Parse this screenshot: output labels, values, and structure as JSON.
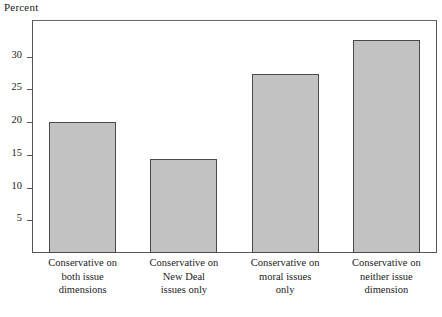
{
  "chart_data": {
    "type": "bar",
    "title": "",
    "subtitle": "",
    "xlabel": "",
    "ylabel": "Percent",
    "ylim": [
      0,
      35.6
    ],
    "grid": false,
    "legend": null,
    "yticks": [
      5,
      10,
      15,
      20,
      25,
      30
    ],
    "ytick_labels": [
      "5",
      "10",
      "15",
      "20",
      "25",
      "30"
    ],
    "categories": [
      "Conservative on both issue dimensions",
      "Conservative on New Deal issues only",
      "Conservative on moral issues only",
      "Conservative on neither issue dimension"
    ],
    "category_label_lines": [
      [
        "Conservative on",
        "both issue",
        "dimensions"
      ],
      [
        "Conservative on",
        "New Deal",
        "issues only"
      ],
      [
        "Conservative on",
        "moral issues",
        "only"
      ],
      [
        "Conservative on",
        "neither issue",
        "dimension"
      ]
    ],
    "values": [
      20.0,
      14.3,
      27.3,
      32.6
    ],
    "bar_fill_color": "#c2c2c2",
    "bar_edge_color": "#4a4a4a",
    "axis_color": "#555555",
    "background_color": "#ffffff"
  }
}
